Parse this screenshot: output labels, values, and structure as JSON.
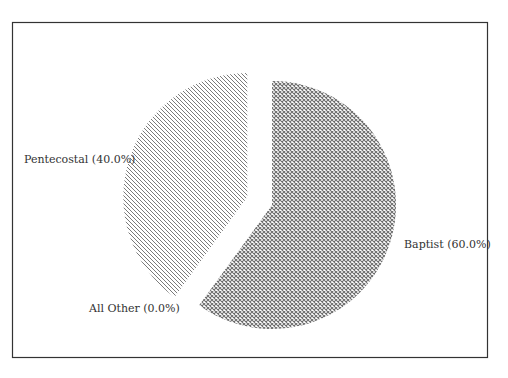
{
  "chart_data": {
    "type": "pie",
    "title": "",
    "slices": [
      {
        "label": "Baptist",
        "value": 60.0,
        "display": "Baptist (60.0%)",
        "pattern": "crosshatch",
        "exploded": false
      },
      {
        "label": "All Other",
        "value": 0.0,
        "display": "All Other (0.0%)",
        "pattern": "none",
        "exploded": true
      },
      {
        "label": "Pentecostal",
        "value": 40.0,
        "display": "Pentecostal (40.0%)",
        "pattern": "diagonal",
        "exploded": true
      }
    ],
    "start_angle_deg": 90,
    "direction": "clockwise",
    "legend": "none",
    "colors": {
      "ink": "#555555",
      "frame": "#333333",
      "background": "#ffffff"
    }
  }
}
